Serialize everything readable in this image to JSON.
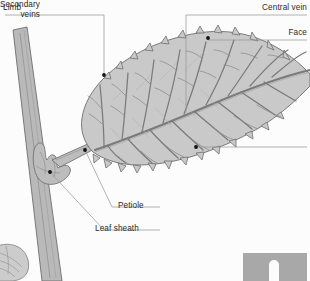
{
  "diagram": {
    "subject": "leaf",
    "background_color": "#fcfcfc",
    "blade_fill": "#c9c9c9",
    "blade_stroke": "#6e6e6e",
    "stem_fill": "#b9b9b9",
    "stem_stroke": "#6e6e6e",
    "vein_color": "#7a7a7a",
    "leader_color": "#9a9a9a",
    "marker_color": "#121212",
    "label_color": "#2b2b2b"
  },
  "labels": {
    "limb": "Limb",
    "central_vein": "Central vein",
    "face": "Face",
    "secondary_veins": "Secondary\nveins",
    "petiole": "Petiole",
    "leaf_sheath": "Leaf sheath"
  },
  "parts": [
    {
      "id": "limb",
      "name": "Limb",
      "marker": [
        104,
        75
      ]
    },
    {
      "id": "central-vein",
      "name": "Central vein",
      "marker": [
        null,
        null
      ]
    },
    {
      "id": "face",
      "name": "Face",
      "marker": [
        208,
        38
      ]
    },
    {
      "id": "secondary-veins",
      "name": "Secondary veins",
      "marker": [
        196,
        147
      ]
    },
    {
      "id": "petiole",
      "name": "Petiole",
      "marker": [
        85,
        150
      ]
    },
    {
      "id": "leaf-sheath",
      "name": "Leaf sheath",
      "marker": [
        50,
        172
      ]
    }
  ],
  "inset": {
    "swatch_fill": "#a8a8a8",
    "notch_fill": "#fcfcfc"
  }
}
